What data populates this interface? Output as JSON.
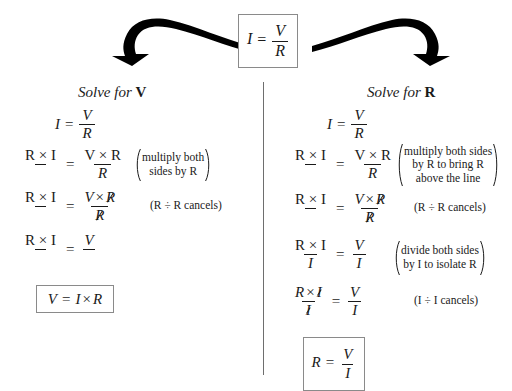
{
  "document": {
    "title": "Ohm's Law Algebraic Rearrangement",
    "source_formula": {
      "left": "I",
      "equals": "=",
      "numerator": "V",
      "denominator": "R"
    },
    "symbols": {
      "times": "×",
      "divide": "÷",
      "equals": "=",
      "open_paren": "(",
      "close_paren": ")"
    },
    "divider": {
      "orientation": "vertical",
      "color": "#6e6e6e"
    },
    "arrows": [
      {
        "name": "arrow-to-left-column",
        "direction": "down-left",
        "color": "#000000"
      },
      {
        "name": "arrow-to-right-column",
        "direction": "down-right",
        "color": "#000000"
      }
    ],
    "columns": [
      {
        "id": "solve-for-v",
        "heading_prefix": "Solve for",
        "heading_variable": "V",
        "steps": [
          {
            "id": "v-step-1",
            "lhs": {
              "type": "plain",
              "text": "I"
            },
            "rhs": {
              "type": "fraction",
              "num": "V",
              "den": "R"
            },
            "note": null
          },
          {
            "id": "v-step-2",
            "lhs": {
              "type": "fraction",
              "num": "R × I",
              "den": ""
            },
            "rhs": {
              "type": "fraction",
              "num": "V × R",
              "den": "R"
            },
            "note": {
              "style": "paren",
              "lines": [
                "multiply both",
                "sides by R"
              ]
            }
          },
          {
            "id": "v-step-3",
            "lhs": {
              "type": "fraction",
              "num": "R × I",
              "den": ""
            },
            "rhs": {
              "type": "fraction",
              "num": "V × R",
              "den": "R",
              "cancelled": true
            },
            "note": {
              "style": "plain",
              "lines": [
                "(R ÷ R cancels)"
              ]
            }
          },
          {
            "id": "v-step-4",
            "lhs": {
              "type": "fraction",
              "num": "R × I",
              "den": ""
            },
            "rhs": {
              "type": "fraction",
              "num": "V",
              "den": ""
            },
            "note": null
          }
        ],
        "result": {
          "id": "result-v",
          "text": "V = I × R"
        }
      },
      {
        "id": "solve-for-r",
        "heading_prefix": "Solve for",
        "heading_variable": "R",
        "steps": [
          {
            "id": "r-step-1",
            "lhs": {
              "type": "plain",
              "text": "I"
            },
            "rhs": {
              "type": "fraction",
              "num": "V",
              "den": "R"
            },
            "note": null
          },
          {
            "id": "r-step-2",
            "lhs": {
              "type": "fraction",
              "num": "R × I",
              "den": ""
            },
            "rhs": {
              "type": "fraction",
              "num": "V × R",
              "den": "R"
            },
            "note": {
              "style": "paren",
              "lines": [
                "multiply both sides",
                "by R to bring R",
                "above the line"
              ]
            }
          },
          {
            "id": "r-step-3",
            "lhs": {
              "type": "fraction",
              "num": "R × I",
              "den": ""
            },
            "rhs": {
              "type": "fraction",
              "num": "V × R",
              "den": "R",
              "cancelled": true
            },
            "note": {
              "style": "plain",
              "lines": [
                "(R ÷ R cancels)"
              ]
            }
          },
          {
            "id": "r-step-4",
            "lhs": {
              "type": "fraction",
              "num": "R × I",
              "den": "I"
            },
            "rhs": {
              "type": "fraction",
              "num": "V",
              "den": "I"
            },
            "note": {
              "style": "paren",
              "lines": [
                "divide both sides",
                "by I to isolate R"
              ]
            }
          },
          {
            "id": "r-step-5",
            "lhs": {
              "type": "fraction",
              "num": "R × I",
              "den": "I",
              "cancelled": true
            },
            "rhs": {
              "type": "fraction",
              "num": "V",
              "den": "I"
            },
            "note": {
              "style": "plain",
              "lines": [
                "(I ÷ I cancels)"
              ]
            }
          }
        ],
        "result": {
          "id": "result-r",
          "num": "V",
          "den": "I",
          "lhs": "R"
        }
      }
    ]
  }
}
